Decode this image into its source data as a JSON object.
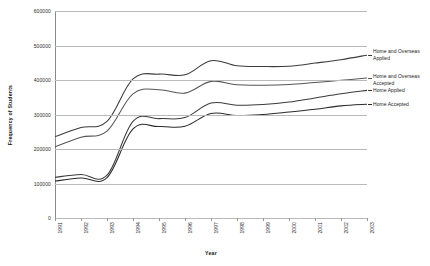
{
  "chart_data": {
    "type": "line",
    "title": "",
    "xlabel": "Year",
    "ylabel": "Frequency of Students",
    "grid": true,
    "legend_position": "right-inline-end-of-line",
    "categories": [
      "1991",
      "1992",
      "1993",
      "1994",
      "1995",
      "1996",
      "1997",
      "1998",
      "1999",
      "2000",
      "2001",
      "2002",
      "2003"
    ],
    "ylim": [
      0,
      600000
    ],
    "yticks": [
      "0",
      "100000",
      "200000",
      "300000",
      "400000",
      "500000",
      "600000"
    ],
    "ytick_values": [
      0,
      100000,
      200000,
      300000,
      400000,
      500000,
      600000
    ],
    "series": [
      {
        "name": "Home and Overseas Applied",
        "label": "Home and Overseas\nApplied",
        "color": "#3b3b3b",
        "values": [
          236000,
          262000,
          280000,
          403000,
          417000,
          415000,
          456000,
          441000,
          439000,
          440000,
          449000,
          459000,
          472000
        ]
      },
      {
        "name": "Home and Overseas Accepted",
        "label": "Home and Overseas\nAccepted",
        "color": "#565656",
        "values": [
          206000,
          234000,
          252000,
          360000,
          372000,
          362000,
          396000,
          386000,
          385000,
          387000,
          393000,
          399000,
          406000
        ]
      },
      {
        "name": "Home Applied",
        "label": "Home Applied",
        "color": "#3b3b3b",
        "values": [
          118000,
          126000,
          124000,
          280000,
          288000,
          291000,
          333000,
          327000,
          329000,
          336000,
          348000,
          360000,
          370000
        ]
      },
      {
        "name": "Home Accepted",
        "label": "Home Accepted",
        "color": "#2b2b2b",
        "values": [
          107000,
          116000,
          117000,
          258000,
          265000,
          266000,
          303000,
          297000,
          300000,
          307000,
          315000,
          325000,
          330000
        ]
      }
    ]
  },
  "axis": {
    "y_title": "Frequency of Students",
    "x_title": "Year"
  }
}
